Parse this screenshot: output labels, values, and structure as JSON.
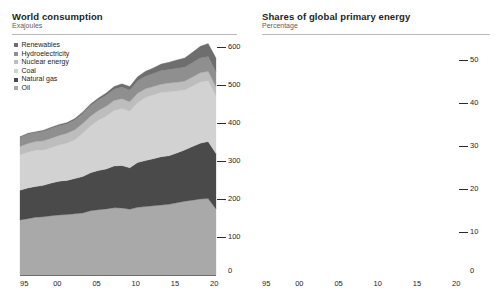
{
  "panels": {
    "left": {
      "title": "World consumption",
      "subtitle": "Exajoules",
      "legend": [
        {
          "label": "Renewables",
          "color": "#6e6e6e"
        },
        {
          "label": "Hydroelectricity",
          "color": "#8f8f8f"
        },
        {
          "label": "Nuclear energy",
          "color": "#bdbdbd"
        },
        {
          "label": "Coal",
          "color": "#d2d2d2"
        },
        {
          "label": "Natural gas",
          "color": "#4a4a4a"
        },
        {
          "label": "Oil",
          "color": "#a9a9a9"
        }
      ],
      "yticks": [
        "0",
        "100",
        "200",
        "300",
        "400",
        "500",
        "600"
      ],
      "xticks": [
        "95",
        "00",
        "05",
        "10",
        "15",
        "20"
      ],
      "zero_label": "0"
    },
    "right": {
      "title": "Shares of global primary energy",
      "subtitle": "Percentage",
      "legend": [
        {
          "label": "Oil",
          "color": "#bdbdbd"
        },
        {
          "label": "Hydroelectricity",
          "color": "#8f8f8f"
        },
        {
          "label": "Coal",
          "color": "#cfcfcf"
        },
        {
          "label": "Nuclear energy",
          "color": "#bdbdbd"
        },
        {
          "label": "Natural gas",
          "color": "#3c3c3c"
        },
        {
          "label": "Renewables",
          "color": "#6e6e6e"
        }
      ],
      "yticks": [
        "0",
        "10",
        "20",
        "30",
        "40",
        "50"
      ],
      "xticks": [
        "95",
        "00",
        "05",
        "10",
        "15",
        "20"
      ],
      "zero_label": "0"
    }
  },
  "chart_data": [
    {
      "type": "area",
      "id": "world-consumption",
      "title": "World consumption",
      "subtitle": "Exajoules",
      "xlabel": "",
      "ylabel": "Exajoules",
      "stacked": true,
      "grid": false,
      "legend_position": "top-left",
      "xlim": [
        1995,
        2020
      ],
      "ylim": [
        0,
        600
      ],
      "yticks": [
        0,
        100,
        200,
        300,
        400,
        500,
        600
      ],
      "xticks": [
        1995,
        2000,
        2005,
        2010,
        2015,
        2020
      ],
      "xtick_labels": [
        "95",
        "00",
        "05",
        "10",
        "15",
        "20"
      ],
      "x": [
        1995,
        1996,
        1997,
        1998,
        1999,
        2000,
        2001,
        2002,
        2003,
        2004,
        2005,
        2006,
        2007,
        2008,
        2009,
        2010,
        2011,
        2012,
        2013,
        2014,
        2015,
        2016,
        2017,
        2018,
        2019,
        2020
      ],
      "series": [
        {
          "name": "Oil",
          "color": "#a9a9a9",
          "values": [
            145,
            148,
            152,
            153,
            156,
            158,
            159,
            161,
            163,
            169,
            172,
            174,
            177,
            176,
            173,
            178,
            180,
            182,
            184,
            186,
            190,
            194,
            197,
            200,
            201,
            174
          ]
        },
        {
          "name": "Natural gas",
          "color": "#4a4a4a",
          "values": [
            78,
            81,
            81,
            83,
            86,
            89,
            90,
            93,
            96,
            100,
            103,
            105,
            110,
            112,
            109,
            118,
            121,
            124,
            127,
            128,
            131,
            135,
            141,
            147,
            150,
            146
          ]
        },
        {
          "name": "Coal",
          "color": "#d2d2d2",
          "values": [
            93,
            94,
            95,
            93,
            93,
            95,
            98,
            102,
            114,
            123,
            132,
            139,
            146,
            150,
            149,
            157,
            166,
            168,
            169,
            168,
            163,
            158,
            159,
            161,
            160,
            151
          ]
        },
        {
          "name": "Nuclear energy",
          "color": "#bdbdbd",
          "values": [
            22,
            23,
            23,
            24,
            25,
            25,
            26,
            26,
            26,
            26,
            26,
            26,
            26,
            26,
            25,
            25,
            23,
            22,
            22,
            23,
            23,
            23,
            24,
            24,
            25,
            24
          ]
        },
        {
          "name": "Hydroelectricity",
          "color": "#8f8f8f",
          "values": [
            24,
            25,
            24,
            25,
            26,
            26,
            25,
            26,
            26,
            28,
            28,
            29,
            30,
            31,
            31,
            33,
            33,
            34,
            36,
            36,
            37,
            37,
            38,
            39,
            39,
            40
          ]
        },
        {
          "name": "Renewables",
          "color": "#6e6e6e",
          "values": [
            2,
            2,
            2,
            3,
            3,
            3,
            3,
            4,
            4,
            4,
            5,
            6,
            7,
            8,
            9,
            11,
            13,
            15,
            17,
            19,
            22,
            24,
            27,
            31,
            34,
            36
          ]
        }
      ]
    },
    {
      "type": "line",
      "id": "shares-of-global-primary-energy",
      "title": "Shares of global primary energy",
      "subtitle": "Percentage",
      "xlabel": "",
      "ylabel": "Percentage",
      "grid": true,
      "legend_position": "top",
      "xlim": [
        1995,
        2020
      ],
      "ylim": [
        0,
        50
      ],
      "yticks": [
        0,
        10,
        20,
        30,
        40,
        50
      ],
      "xticks": [
        1995,
        2000,
        2005,
        2010,
        2015,
        2020
      ],
      "xtick_labels": [
        "95",
        "00",
        "05",
        "10",
        "15",
        "20"
      ],
      "x": [
        1995,
        1996,
        1997,
        1998,
        1999,
        2000,
        2001,
        2002,
        2003,
        2004,
        2005,
        2006,
        2007,
        2008,
        2009,
        2010,
        2011,
        2012,
        2013,
        2014,
        2015,
        2016,
        2017,
        2018,
        2019,
        2020
      ],
      "series": [
        {
          "name": "Oil",
          "color": "#9b9b9b",
          "values": [
            39.6,
            39.7,
            39.9,
            40.0,
            39.8,
            39.4,
            39.0,
            38.6,
            37.7,
            37.1,
            36.4,
            35.6,
            34.9,
            34.3,
            34.1,
            33.3,
            32.8,
            32.6,
            32.4,
            32.5,
            32.5,
            32.7,
            32.6,
            32.4,
            32.0,
            30.6
          ]
        },
        {
          "name": "Coal",
          "color": "#bdbdbd",
          "values": [
            25.4,
            25.3,
            25.0,
            24.3,
            23.7,
            23.6,
            24.0,
            24.4,
            26.3,
            27.0,
            27.9,
            28.4,
            28.8,
            29.2,
            29.3,
            29.4,
            30.3,
            30.1,
            29.8,
            29.4,
            27.9,
            26.6,
            26.3,
            26.1,
            25.4,
            26.5
          ]
        },
        {
          "name": "Natural gas",
          "color": "#3c3c3c",
          "values": [
            21.3,
            21.8,
            21.3,
            21.7,
            22.0,
            22.1,
            22.1,
            22.3,
            22.2,
            22.0,
            21.8,
            21.5,
            21.7,
            21.8,
            21.5,
            22.1,
            22.1,
            22.2,
            22.4,
            22.4,
            22.5,
            22.8,
            23.3,
            23.9,
            24.2,
            24.7
          ]
        },
        {
          "name": "Hydroelectricity",
          "color": "#8f8f8f",
          "values": [
            6.6,
            6.6,
            6.4,
            6.5,
            6.5,
            6.4,
            6.2,
            6.2,
            6.0,
            6.1,
            5.9,
            5.9,
            5.9,
            6.1,
            6.2,
            6.2,
            6.1,
            6.2,
            6.3,
            6.3,
            6.3,
            6.3,
            6.3,
            6.3,
            6.4,
            6.9
          ]
        },
        {
          "name": "Nuclear energy",
          "color": "#bdbdbd",
          "values": [
            6.1,
            6.1,
            6.0,
            6.2,
            6.2,
            6.1,
            6.2,
            6.1,
            5.9,
            5.7,
            5.5,
            5.4,
            5.1,
            5.1,
            5.1,
            4.9,
            4.5,
            4.3,
            4.3,
            4.4,
            4.4,
            4.4,
            4.4,
            4.4,
            4.3,
            4.3
          ]
        },
        {
          "name": "Renewables",
          "color": "#6e6e6e",
          "values": [
            0.6,
            0.6,
            0.6,
            0.7,
            0.7,
            0.7,
            0.7,
            0.8,
            0.8,
            0.9,
            1.0,
            1.1,
            1.2,
            1.4,
            1.6,
            1.9,
            2.2,
            2.5,
            2.9,
            3.3,
            3.8,
            4.2,
            4.8,
            5.4,
            6.0,
            6.7
          ]
        }
      ]
    }
  ]
}
